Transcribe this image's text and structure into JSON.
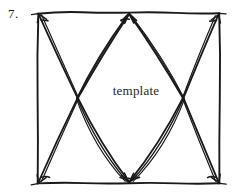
{
  "figure": {
    "item_number": "7.",
    "center_label": "template",
    "ink_color": "#1a1a1a",
    "background_color": "#ffffff",
    "style": "hand-drawn pen sketch",
    "frame": {
      "name": "rectangular-border",
      "corners": {
        "top_left": [
          38,
          13
        ],
        "top_right": [
          219,
          14
        ],
        "bottom_right": [
          219,
          183
        ],
        "bottom_left": [
          38,
          183
        ]
      }
    },
    "vertices": {
      "top_middle": [
        129,
        13
      ],
      "bottom_middle": [
        129,
        183
      ],
      "left_cross": [
        78,
        98
      ],
      "right_cross": [
        183,
        98
      ]
    },
    "edges": [
      {
        "from": "top_left",
        "to": "left_cross"
      },
      {
        "from": "top_middle",
        "to": "left_cross"
      },
      {
        "from": "top_middle",
        "to": "right_cross"
      },
      {
        "from": "top_right",
        "to": "right_cross"
      },
      {
        "from": "bottom_left",
        "to": "left_cross"
      },
      {
        "from": "bottom_middle",
        "to": "left_cross"
      },
      {
        "from": "bottom_middle",
        "to": "right_cross"
      },
      {
        "from": "bottom_right",
        "to": "right_cross"
      }
    ],
    "arrowheads_at": [
      "top_left",
      "top_middle",
      "top_right",
      "bottom_left",
      "bottom_middle",
      "bottom_right"
    ]
  }
}
